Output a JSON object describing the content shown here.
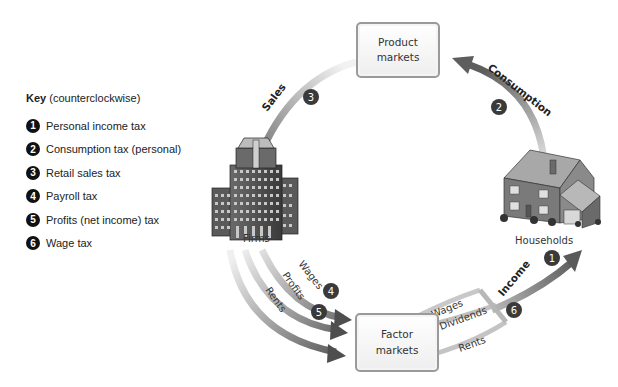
{
  "key": {
    "title_bold": "Key",
    "title_rest": " (counterclockwise)",
    "items": [
      {
        "num": "1",
        "label": "Personal income tax"
      },
      {
        "num": "2",
        "label": "Consumption tax (personal)"
      },
      {
        "num": "3",
        "label": "Retail sales tax"
      },
      {
        "num": "4",
        "label": "Payroll tax"
      },
      {
        "num": "5",
        "label": "Profits (net income) tax"
      },
      {
        "num": "6",
        "label": "Wage tax"
      }
    ]
  },
  "nodes": {
    "product_markets": {
      "line1": "Product",
      "line2": "markets"
    },
    "factor_markets": {
      "line1": "Factor",
      "line2": "markets"
    },
    "firms": "Firms",
    "households": "Households"
  },
  "flows": {
    "sales": "Sales",
    "consumption": "Consumption",
    "income": "Income",
    "firm_wages": "Wages",
    "firm_profits": "Profits",
    "firm_rents": "Rents",
    "hh_wages": "Wages",
    "hh_dividends": "Dividends",
    "hh_rents": "Rents"
  },
  "badges": {
    "b1": "1",
    "b2": "2",
    "b3": "3",
    "b4": "4",
    "b5": "5",
    "b6": "6"
  },
  "colors": {
    "arrow_dark": "#555555",
    "arrow_light": "#e6e6e6",
    "badge": "#3a3a3a",
    "box_border": "#9a9a9a"
  }
}
